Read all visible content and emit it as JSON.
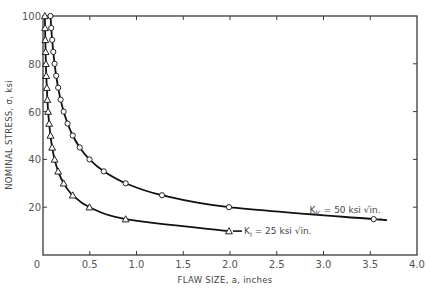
{
  "chart_data": {
    "type": "line",
    "title": "",
    "xlabel": "FLAW SIZE, a, inches",
    "ylabel": "NOMINAL STRESS, σ, ksi",
    "xlim": [
      0,
      4.0
    ],
    "ylim": [
      0,
      100
    ],
    "x_ticks": [
      "0",
      "0.5",
      "1.0",
      "1.5",
      "2.0",
      "2.5",
      "3.0",
      "3.5",
      "4.0"
    ],
    "x_tick_values": [
      0,
      0.5,
      1.0,
      1.5,
      2.0,
      2.5,
      3.0,
      3.5,
      4.0
    ],
    "y_ticks": [
      "0",
      "20",
      "40",
      "60",
      "80",
      "100"
    ],
    "y_tick_values": [
      0,
      20,
      40,
      60,
      80,
      100
    ],
    "grid": false,
    "frame": "box with inward ticks on all four sides",
    "series": [
      {
        "name": "K_Ic = 50 ksi √in.",
        "label_main": "K",
        "label_sub": "Ic",
        "label_rest": " = 50 ksi √in.",
        "marker": "circle",
        "x": [
          0.08,
          0.088,
          0.098,
          0.11,
          0.124,
          0.141,
          0.162,
          0.188,
          0.221,
          0.263,
          0.318,
          0.393,
          0.497,
          0.65,
          0.884,
          1.273,
          1.989,
          3.537
        ],
        "y": [
          100,
          95,
          90,
          85,
          80,
          75,
          70,
          65,
          60,
          55,
          50,
          45,
          40,
          35,
          30,
          25,
          20,
          15
        ],
        "curve_end_x": 3.6
      },
      {
        "name": "K_I = 25 ksi √in.",
        "label_main": "K",
        "label_sub": "I",
        "label_rest": " = 25 ksi √in.",
        "marker": "triangle",
        "x": [
          0.02,
          0.022,
          0.025,
          0.028,
          0.031,
          0.035,
          0.041,
          0.047,
          0.055,
          0.066,
          0.08,
          0.098,
          0.124,
          0.162,
          0.221,
          0.318,
          0.497,
          0.884,
          1.989
        ],
        "y": [
          100,
          95,
          90,
          85,
          80,
          75,
          70,
          65,
          60,
          55,
          50,
          45,
          40,
          35,
          30,
          25,
          20,
          15,
          10
        ],
        "curve_end_x": 1.989
      }
    ],
    "annotations": [
      {
        "text": "K_Ic = 50 ksi √in.",
        "x": 2.85,
        "y": 19,
        "series": 0
      },
      {
        "text": "K_I = 25 ksi √in.",
        "x": 2.15,
        "y": 10,
        "series": 1,
        "leader_line": true
      }
    ],
    "legend": "inline annotations near curve ends"
  }
}
